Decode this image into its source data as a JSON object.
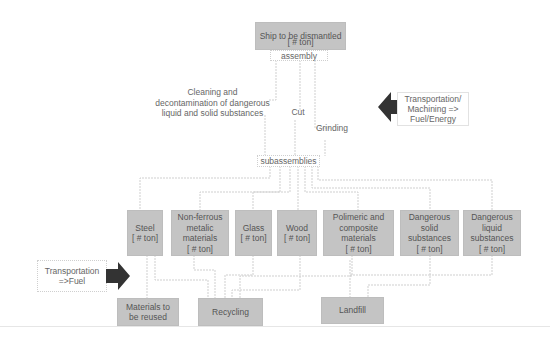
{
  "diagram": {
    "root": {
      "title": "Ship to be dismantled",
      "qty": "[ # ton]",
      "stage_label": "assembly"
    },
    "processes": {
      "cleaning": "Cleaning and\ndecontamination of dangerous\nliquid and solid substances",
      "cut": "Cut",
      "grinding": "Grinding"
    },
    "input_energy": "Transportation/\nMachining =>\nFuel/Energy",
    "intermediate": "subassemblies",
    "materials": [
      {
        "name": "Steel\n[ # ton]"
      },
      {
        "name": "Non-ferrous\nmetalic\nmaterials\n[ # ton]"
      },
      {
        "name": "Glass\n[ # ton]"
      },
      {
        "name": "Wood\n[ # ton]"
      },
      {
        "name": "Polimeric and\ncomposite\nmaterials\n[ # ton]"
      },
      {
        "name": "Dangerous\nsolid\nsubstances\n[ # ton]"
      },
      {
        "name": "Dangerous\nliquid\nsubstances\n[ # ton]"
      }
    ],
    "transport_fuel": "Transportation\n=>Fuel",
    "outputs": [
      {
        "name": "Materials to\nbe reused"
      },
      {
        "name": "Recycling"
      },
      {
        "name": "Landfill"
      }
    ],
    "colors": {
      "box_fill": "#c4c4c4",
      "arrow": "#333333",
      "line": "#c8c8c8"
    }
  }
}
